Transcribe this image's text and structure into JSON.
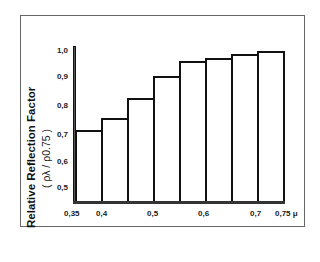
{
  "chart_data": {
    "type": "bar",
    "title": "",
    "xlabel": "μ",
    "ylabel": "Relative Reflection Factor",
    "ylabel_sub": "( ρλ / ρ0.75 )",
    "ylim": [
      0.45,
      1.0
    ],
    "yticks": [
      "0,5",
      "0,6",
      "0,7",
      "0,8",
      "0,9",
      "1,0"
    ],
    "xticks": [
      "0,35",
      "0,4",
      "0,5",
      "0,6",
      "0,7",
      "0,75 μ"
    ],
    "bin_edges": [
      0.35,
      0.4,
      0.45,
      0.5,
      0.55,
      0.6,
      0.65,
      0.7,
      0.75
    ],
    "categories": [
      "0.35-0.40",
      "0.40-0.45",
      "0.45-0.50",
      "0.50-0.55",
      "0.55-0.60",
      "0.60-0.65",
      "0.65-0.70",
      "0.70-0.75"
    ],
    "values": [
      0.71,
      0.755,
      0.83,
      0.91,
      0.965,
      0.975,
      0.99,
      1.0
    ],
    "grid": false,
    "legend": null
  },
  "labels": {
    "ylabel": "Relative Reflection Factor",
    "ysub": "( ρλ / ρ0.75 )",
    "yticks": [
      "1,0",
      "0,9",
      "0,8",
      "0,7",
      "0,6",
      "0,5"
    ],
    "xticks": [
      "0,35",
      "0,4",
      "0,5",
      "0,6",
      "0,7",
      "0,75 μ"
    ]
  }
}
